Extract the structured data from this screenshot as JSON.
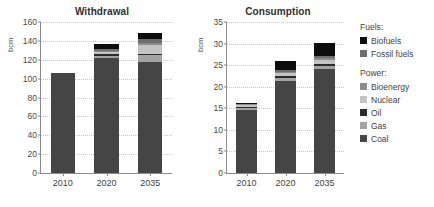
{
  "chart_data": [
    {
      "type": "bar",
      "title": "Withdrawal",
      "xlabel": "",
      "ylabel": "bcm",
      "ylim": [
        0,
        160
      ],
      "ytick_step": 20,
      "yticks": [
        "0",
        "20",
        "40",
        "60",
        "80",
        "100",
        "120",
        "140",
        "160"
      ],
      "grid": true,
      "stacked": true,
      "categories": [
        "2010",
        "2020",
        "2035"
      ],
      "series": [
        {
          "name": "Coal",
          "values": [
            105.5,
            122.0,
            117.5
          ]
        },
        {
          "name": "Gas",
          "values": [
            0.0,
            2.5,
            7.5
          ]
        },
        {
          "name": "Oil",
          "values": [
            0.0,
            1.5,
            1.5
          ]
        },
        {
          "name": "Nuclear",
          "values": [
            0.0,
            2.5,
            9.0
          ]
        },
        {
          "name": "Bioenergy",
          "values": [
            0.0,
            1.0,
            2.5
          ]
        },
        {
          "name": "Fossil fuels",
          "values": [
            0.0,
            1.5,
            4.0
          ]
        },
        {
          "name": "Biofuels",
          "values": [
            0.0,
            5.5,
            6.0
          ]
        }
      ],
      "totals": [
        105.5,
        136.5,
        148.0
      ]
    },
    {
      "type": "bar",
      "title": "Consumption",
      "xlabel": "",
      "ylabel": "bcm",
      "ylim": [
        0,
        35
      ],
      "ytick_step": 5,
      "yticks": [
        "0",
        "5",
        "10",
        "15",
        "20",
        "25",
        "30",
        "35"
      ],
      "grid": true,
      "stacked": true,
      "categories": [
        "2010",
        "2020",
        "2035"
      ],
      "series": [
        {
          "name": "Coal",
          "values": [
            14.7,
            21.4,
            24.0
          ]
        },
        {
          "name": "Gas",
          "values": [
            0.35,
            0.7,
            0.8
          ]
        },
        {
          "name": "Oil",
          "values": [
            0.2,
            0.4,
            0.5
          ]
        },
        {
          "name": "Nuclear",
          "values": [
            0.5,
            0.7,
            1.0
          ]
        },
        {
          "name": "Bioenergy",
          "values": [
            0.15,
            0.3,
            0.4
          ]
        },
        {
          "name": "Fossil fuels",
          "values": [
            0.1,
            0.3,
            0.5
          ]
        },
        {
          "name": "Biofuels",
          "values": [
            0.3,
            2.2,
            3.0
          ]
        }
      ],
      "totals": [
        16.3,
        26.0,
        30.2
      ]
    }
  ],
  "panels": {
    "withdrawal": {
      "title": "Withdrawal",
      "unit": "bcm"
    },
    "consumption": {
      "title": "Consumption",
      "unit": "bcm"
    }
  },
  "legend": {
    "position": "right",
    "groups": [
      {
        "title": "Fuels:",
        "items": [
          {
            "label": "Biofuels",
            "color": "#0d0d0d"
          },
          {
            "label": "Fossil fuels",
            "color": "#6e6e6e"
          }
        ]
      },
      {
        "title": "Power:",
        "items": [
          {
            "label": "Bioenergy",
            "color": "#8c8c8c"
          },
          {
            "label": "Nuclear",
            "color": "#c4c4c4"
          },
          {
            "label": "Oil",
            "color": "#2b2b2b"
          },
          {
            "label": "Gas",
            "color": "#a3a3a3"
          },
          {
            "label": "Coal",
            "color": "#454545"
          }
        ]
      }
    ]
  },
  "colors": {
    "biofuels": "#0d0d0d",
    "fossil_fuels": "#6e6e6e",
    "bioenergy": "#8c8c8c",
    "nuclear": "#c4c4c4",
    "oil": "#2b2b2b",
    "gas": "#a3a3a3",
    "coal": "#454545",
    "axis": "#8a8a8a",
    "grid": "#c9c9c9",
    "text": "#3f3f3f"
  }
}
